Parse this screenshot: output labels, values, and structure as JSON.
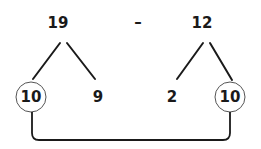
{
  "diagram": {
    "type": "number-bond-subtraction",
    "minuend": {
      "value": "19",
      "parts": [
        "10",
        "9"
      ]
    },
    "operator": "–",
    "subtrahend": {
      "value": "12",
      "parts": [
        "2",
        "10"
      ]
    },
    "circled": [
      "10",
      "10"
    ],
    "connector": "links circled 10 of 19 to circled 10 of 12"
  },
  "colors": {
    "ink": "#1a1a1a",
    "circle": "#555555",
    "background": "#ffffff"
  }
}
